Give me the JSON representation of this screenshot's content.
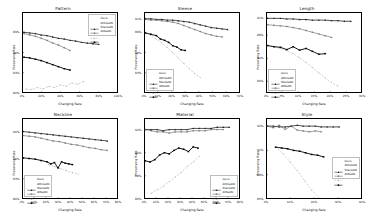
{
  "figure": {
    "background": "#ffffff",
    "rows": 2,
    "cols": 3,
    "xlabel": "Changing Rate",
    "ylabel": "Preserving Rate"
  },
  "series_styles": {
    "ours": {
      "color": "#1a1a1a",
      "dash": "none",
      "marker": "triangle",
      "width": 0.75
    },
    "attngan": {
      "color": "#555555",
      "dash": "none",
      "marker": "plus",
      "width": 0.55
    },
    "stargan": {
      "color": "#9e9e9e",
      "dash": "2,1.5",
      "marker": "dot",
      "width": 0.5
    },
    "attgan": {
      "color": "#000000",
      "dash": "none",
      "marker": "square",
      "width": 0.9
    }
  },
  "legend_labels": {
    "ours": "Ours",
    "attngan": "AttnGAN",
    "stargan": "StarGAN",
    "attgan": "AttGAN"
  },
  "chart_data": [
    {
      "id": "pattern",
      "type": "line",
      "title": "Pattern",
      "xlabel": "Changing Rate",
      "ylabel": "Preserving Rate",
      "xlim": [
        0,
        100
      ],
      "ylim": [
        80,
        92
      ],
      "xticks": [
        0,
        20,
        40,
        60,
        80,
        100
      ],
      "xticklabels": [
        "0%",
        "20%",
        "40%",
        "60%",
        "80%",
        "100%"
      ],
      "yticks": [
        80,
        83,
        86,
        89
      ],
      "yticklabels": [
        "80%",
        "83%",
        "86%",
        "89%"
      ],
      "grid": false,
      "legend_position": "upper-right",
      "series": [
        {
          "name": "Ours",
          "key": "ours",
          "x": [
            2,
            8,
            14,
            20,
            26,
            32,
            38,
            44,
            50,
            56,
            62,
            68,
            74,
            80
          ],
          "y": [
            89.0,
            88.9,
            88.8,
            88.6,
            88.5,
            88.3,
            88.1,
            88.0,
            87.8,
            87.7,
            87.5,
            87.4,
            87.3,
            87.2
          ]
        },
        {
          "name": "AttnGAN",
          "key": "attngan",
          "x": [
            2,
            8,
            14,
            20,
            26,
            32,
            38,
            44,
            50
          ],
          "y": [
            88.8,
            88.6,
            88.4,
            88.1,
            87.8,
            87.4,
            87.1,
            86.7,
            86.3
          ]
        },
        {
          "name": "StarGAN",
          "key": "stargan",
          "x": [
            4,
            10,
            16,
            22,
            28,
            34,
            40,
            46,
            52,
            58,
            64
          ],
          "y": [
            80.6,
            80.5,
            80.8,
            80.6,
            81.0,
            80.8,
            81.2,
            81.0,
            81.5,
            81.3,
            81.7
          ]
        },
        {
          "name": "AttGAN",
          "key": "attgan",
          "x": [
            2,
            8,
            14,
            20,
            26,
            32,
            38,
            44,
            50
          ],
          "y": [
            85.3,
            85.2,
            85.0,
            84.8,
            84.5,
            84.2,
            83.9,
            83.6,
            83.4
          ]
        }
      ]
    },
    {
      "id": "sleeve",
      "type": "line",
      "title": "Sleeve",
      "xlabel": "Changing Rate",
      "ylabel": "Preserving Rate",
      "xlim": [
        0,
        70
      ],
      "ylim": [
        80,
        92
      ],
      "xticks": [
        0,
        10,
        20,
        30,
        40,
        50,
        60,
        70
      ],
      "xticklabels": [
        "0%",
        "10%",
        "20%",
        "30%",
        "40%",
        "50%",
        "60%",
        "70%"
      ],
      "yticks": [
        83,
        86,
        89,
        91
      ],
      "yticklabels": [
        "83%",
        "86%",
        "89%",
        "91%"
      ],
      "grid": false,
      "legend_position": "lower-left",
      "series": [
        {
          "name": "Ours",
          "key": "ours",
          "x": [
            1,
            5,
            9,
            13,
            17,
            21,
            25,
            29,
            33,
            37,
            41,
            45,
            49,
            53,
            57,
            61
          ],
          "y": [
            91.0,
            91.0,
            90.9,
            90.9,
            90.8,
            90.8,
            90.7,
            90.6,
            90.5,
            90.3,
            90.1,
            89.9,
            89.7,
            89.6,
            89.5,
            89.4
          ]
        },
        {
          "name": "AttnGAN",
          "key": "attngan",
          "x": [
            1,
            5,
            9,
            13,
            17,
            21,
            25,
            29,
            33,
            37,
            41,
            45,
            49,
            53,
            57
          ],
          "y": [
            90.9,
            90.8,
            90.8,
            90.7,
            90.6,
            90.5,
            90.3,
            90.0,
            89.7,
            89.4,
            89.1,
            88.8,
            88.6,
            88.4,
            88.3
          ]
        },
        {
          "name": "StarGAN",
          "key": "stargan",
          "x": [
            1,
            5,
            9,
            13,
            17,
            21,
            25,
            29,
            33,
            37,
            41
          ],
          "y": [
            88.9,
            88.5,
            88.0,
            87.4,
            86.7,
            86.0,
            85.2,
            84.4,
            83.6,
            82.9,
            82.3
          ]
        },
        {
          "name": "AttGAN",
          "key": "attgan",
          "x": [
            1,
            5,
            9,
            12,
            15,
            18,
            21,
            24,
            27,
            30
          ],
          "y": [
            88.9,
            88.7,
            88.5,
            88.0,
            87.8,
            87.5,
            87.0,
            86.8,
            86.4,
            86.3
          ]
        }
      ]
    },
    {
      "id": "length",
      "type": "line",
      "title": "Length",
      "xlabel": "Changing Rate",
      "ylabel": "Preserving Rate",
      "xlim": [
        0,
        30
      ],
      "ylim": [
        78,
        92
      ],
      "xticks": [
        0,
        5,
        10,
        15,
        20,
        25,
        30
      ],
      "xticklabels": [
        "0%",
        "5%",
        "10%",
        "15%",
        "20%",
        "25%",
        "30%"
      ],
      "yticks": [
        80,
        84,
        88,
        91
      ],
      "yticklabels": [
        "80%",
        "84%",
        "88%",
        "91%"
      ],
      "grid": false,
      "legend_position": "lower-left",
      "series": [
        {
          "name": "Ours",
          "key": "ours",
          "x": [
            0.5,
            2.5,
            4.5,
            6.5,
            8.5,
            10.5,
            12.5,
            14.5,
            16.5,
            18.5,
            20.5,
            22.5,
            24.5,
            26.5
          ],
          "y": [
            90.9,
            90.9,
            90.9,
            90.8,
            90.8,
            90.7,
            90.7,
            90.6,
            90.6,
            90.6,
            90.5,
            90.5,
            90.4,
            90.4
          ]
        },
        {
          "name": "AttnGAN",
          "key": "attngan",
          "x": [
            0.5,
            2.5,
            4.5,
            6.5,
            8.5,
            10.5,
            12.5,
            14.5,
            16.5,
            18.5,
            20.5
          ],
          "y": [
            89.8,
            89.7,
            89.6,
            89.5,
            89.3,
            89.1,
            88.8,
            88.5,
            88.2,
            87.9,
            87.6
          ]
        },
        {
          "name": "StarGAN",
          "key": "stargan",
          "x": [
            0.5,
            2.5,
            4.5,
            6.5,
            8.5,
            10.5,
            12.5,
            14.5,
            16.5,
            18.5,
            20.5,
            22.5
          ],
          "y": [
            86.2,
            86.0,
            85.7,
            85.3,
            84.8,
            84.1,
            83.3,
            82.4,
            81.5,
            80.6,
            79.8,
            79.2
          ]
        },
        {
          "name": "AttGAN",
          "key": "attgan",
          "x": [
            0.5,
            2.5,
            4.5,
            6.5,
            8.5,
            10.5,
            12.5,
            14.5,
            16.5,
            18.5
          ],
          "y": [
            86.2,
            86.0,
            85.9,
            85.5,
            86.0,
            85.4,
            85.7,
            85.2,
            84.7,
            84.8
          ]
        }
      ]
    },
    {
      "id": "neckline",
      "type": "line",
      "title": "Neckline",
      "xlabel": "Changing Rate",
      "ylabel": "Preserving Rate",
      "xlim": [
        0,
        80
      ],
      "ylim": [
        80,
        92
      ],
      "xticks": [
        0,
        10,
        20,
        30,
        40,
        50,
        60,
        70,
        80
      ],
      "xticklabels": [
        "0%",
        "10%",
        "20%",
        "30%",
        "40%",
        "50%",
        "60%",
        "70%",
        "80%"
      ],
      "yticks": [
        80,
        83,
        86,
        90
      ],
      "yticklabels": [
        "80%",
        "83%",
        "86%",
        "90%"
      ],
      "grid": false,
      "legend_position": "lower-left",
      "series": [
        {
          "name": "Ours",
          "key": "ours",
          "x": [
            1,
            6,
            11,
            16,
            21,
            26,
            31,
            36,
            41,
            46,
            51,
            56,
            61,
            66,
            71
          ],
          "y": [
            90.0,
            89.9,
            89.8,
            89.7,
            89.6,
            89.5,
            89.4,
            89.3,
            89.2,
            89.1,
            89.0,
            88.9,
            88.8,
            88.7,
            88.6
          ]
        },
        {
          "name": "AttnGAN",
          "key": "attngan",
          "x": [
            1,
            6,
            11,
            16,
            21,
            26,
            31,
            36,
            41,
            46,
            51,
            56,
            61,
            66,
            71
          ],
          "y": [
            89.4,
            89.3,
            89.2,
            89.0,
            88.8,
            88.6,
            88.5,
            88.3,
            88.1,
            88.0,
            87.8,
            87.6,
            87.5,
            87.3,
            87.2
          ]
        },
        {
          "name": "StarGAN",
          "key": "stargan",
          "x": [
            22,
            27,
            32,
            37,
            42,
            47
          ],
          "y": [
            85.1,
            84.8,
            84.5,
            84.2,
            83.9,
            83.7
          ]
        },
        {
          "name": "AttGAN",
          "key": "attgan",
          "x": [
            1,
            6,
            11,
            16,
            21,
            24,
            27,
            30,
            33,
            36,
            39,
            42
          ],
          "y": [
            86.1,
            86.0,
            85.9,
            85.7,
            85.5,
            85.2,
            85.4,
            84.6,
            85.5,
            85.3,
            85.2,
            85.1
          ]
        }
      ]
    },
    {
      "id": "material",
      "type": "line",
      "title": "Material",
      "xlabel": "Changing Rate",
      "ylabel": "Preserving Rate",
      "xlim": [
        0,
        80
      ],
      "ylim": [
        86,
        93
      ],
      "xticks": [
        0,
        10,
        20,
        30,
        40,
        50,
        60,
        70,
        80
      ],
      "xticklabels": [
        "0%",
        "10%",
        "20%",
        "30%",
        "40%",
        "50%",
        "60%",
        "70%",
        "80%"
      ],
      "yticks": [
        86,
        88,
        90,
        92
      ],
      "yticklabels": [
        "86%",
        "88%",
        "90%",
        "92%"
      ],
      "grid": false,
      "legend_position": "lower-right",
      "series": [
        {
          "name": "Ours",
          "key": "ours",
          "x": [
            1,
            6,
            11,
            16,
            21,
            26,
            31,
            36,
            41,
            46,
            51,
            56,
            61,
            66,
            71
          ],
          "y": [
            92.0,
            92.0,
            92.0,
            91.9,
            92.0,
            92.0,
            92.0,
            92.0,
            92.1,
            92.1,
            92.1,
            92.1,
            92.2,
            92.2,
            92.2
          ]
        },
        {
          "name": "AttnGAN",
          "key": "attngan",
          "x": [
            1,
            6,
            11,
            16,
            21,
            26,
            31,
            36,
            41,
            46,
            51,
            56,
            61,
            66
          ],
          "y": [
            92.0,
            91.9,
            91.8,
            91.8,
            91.7,
            91.8,
            91.8,
            91.8,
            91.9,
            91.9,
            91.9,
            92.0,
            92.0,
            92.0
          ]
        },
        {
          "name": "StarGAN",
          "key": "stargan",
          "x": [
            6,
            11,
            16,
            21,
            26,
            31,
            36,
            41,
            46
          ],
          "y": [
            86.5,
            86.8,
            87.1,
            87.5,
            87.9,
            88.3,
            88.8,
            89.2,
            89.7
          ]
        },
        {
          "name": "AttGAN",
          "key": "attgan",
          "x": [
            1,
            5,
            9,
            13,
            17,
            21,
            25,
            29,
            33,
            37,
            41,
            45
          ],
          "y": [
            89.3,
            89.2,
            89.4,
            89.8,
            90.0,
            89.9,
            90.2,
            90.4,
            90.3,
            90.1,
            90.5,
            90.4
          ]
        }
      ]
    },
    {
      "id": "style",
      "type": "line",
      "title": "Style",
      "xlabel": "Changing Rate",
      "ylabel": "Preserving Rate",
      "xlim": [
        0,
        40
      ],
      "ylim": [
        85,
        95
      ],
      "xticks": [
        0,
        10,
        20,
        30,
        40
      ],
      "xticklabels": [
        "0%",
        "10%",
        "20%",
        "30%",
        "40%"
      ],
      "yticks": [
        85,
        88,
        91,
        94
      ],
      "yticklabels": [
        "85%",
        "88%",
        "91%",
        "94%"
      ],
      "grid": false,
      "legend_position": "center-right",
      "series": [
        {
          "name": "Ours",
          "key": "ours",
          "x": [
            0.5,
            3,
            5.5,
            8,
            10.5,
            13,
            15.5,
            18,
            20.5,
            23,
            25.5,
            28,
            30.5
          ],
          "y": [
            94.0,
            94.0,
            93.9,
            93.9,
            94.0,
            94.1,
            94.0,
            94.0,
            94.0,
            93.9,
            93.9,
            93.9,
            93.9
          ]
        },
        {
          "name": "AttnGAN",
          "key": "attngan",
          "x": [
            0.5,
            3,
            5.5,
            8,
            10.5,
            13,
            15.5,
            18,
            20.5,
            23
          ],
          "y": [
            94.0,
            93.8,
            94.1,
            93.6,
            94.0,
            93.5,
            93.4,
            93.3,
            93.4,
            93.3
          ]
        },
        {
          "name": "StarGAN",
          "key": "stargan",
          "x": [
            4,
            7,
            10,
            13,
            16,
            19,
            22
          ],
          "y": [
            91.5,
            90.6,
            89.6,
            88.5,
            87.3,
            86.1,
            85.2
          ]
        },
        {
          "name": "AttGAN",
          "key": "attgan",
          "x": [
            4,
            6.5,
            9,
            11.5,
            14,
            16.5,
            19,
            21.5,
            24
          ],
          "y": [
            91.4,
            91.3,
            91.2,
            91.0,
            90.9,
            90.7,
            90.5,
            90.4,
            90.2
          ]
        }
      ]
    }
  ]
}
